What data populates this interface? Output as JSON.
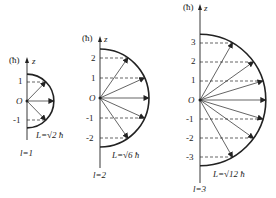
{
  "figure": {
    "unit_label": "(ħ)",
    "axis_label": "z",
    "origin_label": "O",
    "line_color": "#222222",
    "diagrams": [
      {
        "l_label": "l=1",
        "L_label": "L=√2 ħ",
        "ticks": [
          "1",
          "-1"
        ],
        "m_values": [
          1,
          0,
          -1
        ],
        "axis_x": 27,
        "origin_y": 101,
        "unit_px": 19
      },
      {
        "l_label": "l=2",
        "L_label": "L=√6 ħ",
        "ticks": [
          "2",
          "1",
          "-1",
          "-2"
        ],
        "m_values": [
          2,
          1,
          0,
          -1,
          -2
        ],
        "axis_x": 100,
        "origin_y": 98,
        "unit_px": 20
      },
      {
        "l_label": "l=3",
        "L_label": "L=√12 ħ",
        "ticks": [
          "3",
          "2",
          "1",
          "-1",
          "-2",
          "-3"
        ],
        "m_values": [
          3,
          2,
          1,
          0,
          -1,
          -2,
          -3
        ],
        "axis_x": 200,
        "origin_y": 100,
        "unit_px": 19
      }
    ]
  }
}
